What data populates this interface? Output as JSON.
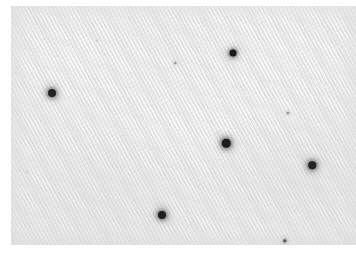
{
  "figure": {
    "kind": "photomicrograph",
    "caption": "",
    "background_color": "#ffffff"
  },
  "photo": {
    "left": 11,
    "top": 6,
    "width": 345,
    "height": 239,
    "base_color": "#f4f4f4",
    "highlight_color": "#fbfbfb",
    "shadow_color": "#e6e6e6",
    "weave": {
      "pattern": "diagonal-twill",
      "thread_color": "#cdcdcd",
      "angle_degrees": 62,
      "period_px": 3.5,
      "description": "fine parallel diagonal ridges running from lower-left to upper-right"
    },
    "particles": [
      {
        "name": "particle-upper-right",
        "x": 233,
        "y": 53,
        "size": 7.0,
        "color": "#1a1a1a",
        "halo": 7
      },
      {
        "name": "particle-left",
        "x": 52,
        "y": 93,
        "size": 8.0,
        "color": "#222222",
        "halo": 8
      },
      {
        "name": "particle-center",
        "x": 226,
        "y": 143,
        "size": 8.5,
        "color": "#1c1c1c",
        "halo": 8
      },
      {
        "name": "particle-right",
        "x": 312,
        "y": 165,
        "size": 7.5,
        "color": "#232323",
        "halo": 8
      },
      {
        "name": "particle-bottom",
        "x": 162,
        "y": 215,
        "size": 8.0,
        "color": "#1f1f1f",
        "halo": 8
      },
      {
        "name": "speck-upper-mid",
        "x": 175,
        "y": 63,
        "size": 1.8,
        "color": "#9a9a9a",
        "halo": 3
      },
      {
        "name": "speck-mid-right",
        "x": 288,
        "y": 113,
        "size": 2.2,
        "color": "#868686",
        "halo": 3
      },
      {
        "name": "speck-bottom-right",
        "x": 285,
        "y": 241,
        "size": 3.4,
        "color": "#575757",
        "halo": 4
      },
      {
        "name": "speck-upper-left",
        "x": 97,
        "y": 41,
        "size": 1.4,
        "color": "#b4b4b4",
        "halo": 2
      },
      {
        "name": "speck-lower-left",
        "x": 27,
        "y": 172,
        "size": 1.3,
        "color": "#bcbcbc",
        "halo": 2
      }
    ]
  }
}
